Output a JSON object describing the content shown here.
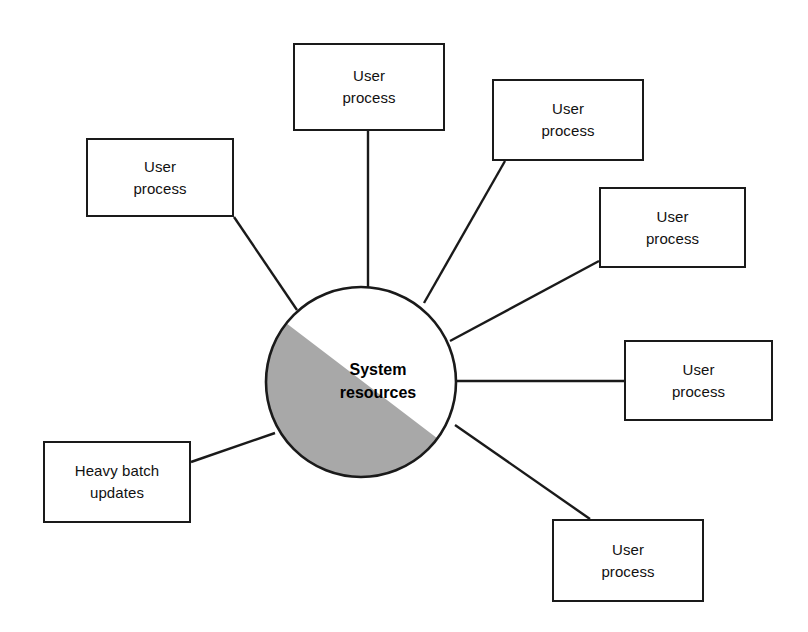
{
  "diagram": {
    "type": "hub-and-spoke",
    "background_color": "#ffffff",
    "line_color": "#1a1a1a",
    "hub": {
      "label": "System\nresources",
      "shape": "circle",
      "center_x": 361,
      "center_y": 382,
      "radius": 95,
      "fill_color": "#ffffff",
      "shade_color": "#a8a8a8",
      "shade_description": "lower-left half shaded gray along a diagonal chord",
      "label_x": 378,
      "label_y": 382
    },
    "nodes": [
      {
        "id": "node-top",
        "label": "User\nprocess",
        "x": 293,
        "y": 43,
        "width": 152,
        "height": 88,
        "connector": {
          "from_x": 368,
          "from_y": 131,
          "to_x": 368,
          "to_y": 288
        }
      },
      {
        "id": "node-upper-right",
        "label": "User\nprocess",
        "x": 492,
        "y": 79,
        "width": 152,
        "height": 82,
        "connector": {
          "from_x": 505,
          "from_y": 161,
          "to_x": 424,
          "to_y": 303
        }
      },
      {
        "id": "node-right-upper",
        "label": "User\nprocess",
        "x": 599,
        "y": 187,
        "width": 147,
        "height": 81,
        "connector": {
          "from_x": 599,
          "from_y": 261,
          "to_x": 450,
          "to_y": 341
        }
      },
      {
        "id": "node-right-middle",
        "label": "User\nprocess",
        "x": 624,
        "y": 340,
        "width": 149,
        "height": 81,
        "connector": {
          "from_x": 624,
          "from_y": 381,
          "to_x": 456,
          "to_y": 381
        }
      },
      {
        "id": "node-bottom-right",
        "label": "User\nprocess",
        "x": 552,
        "y": 519,
        "width": 152,
        "height": 83,
        "connector": {
          "from_x": 590,
          "from_y": 519,
          "to_x": 455,
          "to_y": 425
        }
      },
      {
        "id": "node-lower-left",
        "label": "Heavy batch\nupdates",
        "x": 43,
        "y": 441,
        "width": 148,
        "height": 82,
        "connector": {
          "from_x": 191,
          "from_y": 462,
          "to_x": 275,
          "to_y": 433
        }
      },
      {
        "id": "node-upper-left",
        "label": "User\nprocess",
        "x": 86,
        "y": 138,
        "width": 148,
        "height": 79,
        "connector": {
          "from_x": 234,
          "from_y": 217,
          "to_x": 297,
          "to_y": 310
        }
      }
    ]
  }
}
